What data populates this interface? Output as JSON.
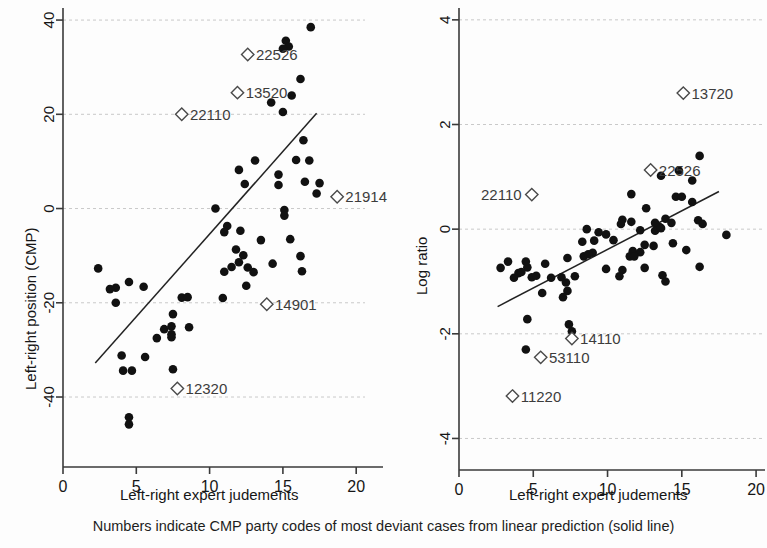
{
  "figure": {
    "caption": "Numbers indicate CMP party codes of most deviant cases from linear prediction (solid line)",
    "width": 767,
    "height": 548,
    "marker_color": "#111111",
    "line_color": "#222222",
    "grid_color": "#c9c9c9"
  },
  "chart_data": [
    {
      "id": "left",
      "type": "scatter",
      "title": "",
      "xlabel": "Left-right expert judements",
      "ylabel": "Left-right position (CMP)",
      "xlim": [
        0,
        20.6
      ],
      "ylim": [
        -47,
        41.5
      ],
      "xticks": [
        0,
        5,
        10,
        15,
        20
      ],
      "xtick_labels": [
        "0",
        "5",
        "10",
        "15",
        "20"
      ],
      "yticks": [
        -40,
        -20,
        0,
        20,
        40
      ],
      "ytick_labels": [
        "-40",
        "-20",
        "0",
        "20",
        "40"
      ],
      "grid": "horizontal",
      "legend": "none",
      "fit_line": {
        "x0": 2.2,
        "y0": -32.8,
        "x1": 17.3,
        "y1": 20.2
      },
      "points": [
        [
          16.9,
          38.5
        ],
        [
          15.2,
          35.6
        ],
        [
          15.4,
          34.4
        ],
        [
          15.0,
          33.9
        ],
        [
          16.2,
          27.5
        ],
        [
          15.6,
          24.0
        ],
        [
          14.2,
          22.5
        ],
        [
          15.0,
          20.5
        ],
        [
          16.4,
          14.5
        ],
        [
          15.9,
          10.3
        ],
        [
          16.8,
          10.2
        ],
        [
          13.1,
          10.2
        ],
        [
          12.0,
          8.2
        ],
        [
          14.7,
          7.2
        ],
        [
          16.5,
          5.7
        ],
        [
          17.5,
          5.4
        ],
        [
          12.4,
          5.2
        ],
        [
          14.7,
          5.0
        ],
        [
          17.3,
          3.2
        ],
        [
          10.4,
          0.0
        ],
        [
          15.1,
          -0.3
        ],
        [
          15.1,
          -1.5
        ],
        [
          11.2,
          -3.7
        ],
        [
          11.0,
          -5.0
        ],
        [
          12.1,
          -4.7
        ],
        [
          13.5,
          -6.7
        ],
        [
          15.5,
          -6.5
        ],
        [
          11.8,
          -8.7
        ],
        [
          12.3,
          -9.9
        ],
        [
          16.2,
          -10.1
        ],
        [
          12.0,
          -11.4
        ],
        [
          14.3,
          -11.7
        ],
        [
          11.5,
          -12.4
        ],
        [
          13.0,
          -13.5
        ],
        [
          11.0,
          -13.4
        ],
        [
          2.4,
          -12.7
        ],
        [
          3.6,
          -16.8
        ],
        [
          3.2,
          -17.1
        ],
        [
          4.5,
          -15.6
        ],
        [
          5.5,
          -16.6
        ],
        [
          3.6,
          -20.0
        ],
        [
          8.1,
          -18.9
        ],
        [
          8.5,
          -18.8
        ],
        [
          10.9,
          -19.0
        ],
        [
          12.5,
          -16.4
        ],
        [
          16.3,
          -13.3
        ],
        [
          12.6,
          -12.5
        ],
        [
          7.5,
          -22.4
        ],
        [
          6.9,
          -25.6
        ],
        [
          7.4,
          -25.0
        ],
        [
          8.6,
          -25.2
        ],
        [
          7.4,
          -26.7
        ],
        [
          7.4,
          -27.3
        ],
        [
          6.4,
          -27.5
        ],
        [
          4.0,
          -31.2
        ],
        [
          5.6,
          -31.5
        ],
        [
          4.1,
          -34.4
        ],
        [
          4.7,
          -34.4
        ],
        [
          7.5,
          -34.1
        ],
        [
          4.5,
          -44.3
        ],
        [
          4.5,
          -45.8
        ]
      ],
      "labeled_points": [
        {
          "code": "22526",
          "x": 12.6,
          "y": 32.7,
          "label_side": "right"
        },
        {
          "code": "13520",
          "x": 11.9,
          "y": 24.6,
          "label_side": "right"
        },
        {
          "code": "22110",
          "x": 8.1,
          "y": 20.0,
          "label_side": "right"
        },
        {
          "code": "21914",
          "x": 18.7,
          "y": 2.5,
          "label_side": "right"
        },
        {
          "code": "14901",
          "x": 13.9,
          "y": -20.3,
          "label_side": "right"
        },
        {
          "code": "12320",
          "x": 7.8,
          "y": -38.2,
          "label_side": "right"
        }
      ]
    },
    {
      "id": "right",
      "type": "scatter",
      "title": "",
      "xlabel": "Left-right expert judements",
      "ylabel": "Log ratio",
      "xlim": [
        0,
        20.6
      ],
      "ylim": [
        -4.45,
        4.15
      ],
      "xticks": [
        0,
        5,
        10,
        15,
        20
      ],
      "xtick_labels": [
        "0",
        "5",
        "10",
        "15",
        "20"
      ],
      "yticks": [
        -4,
        -2,
        0,
        2,
        4
      ],
      "ytick_labels": [
        "-4",
        "-2",
        "0",
        "2",
        "4"
      ],
      "grid": "horizontal",
      "legend": "none",
      "fit_line": {
        "x0": 2.6,
        "y0": -1.48,
        "x1": 17.5,
        "y1": 0.72
      },
      "points": [
        [
          16.2,
          1.4
        ],
        [
          14.8,
          1.12
        ],
        [
          13.6,
          1.02
        ],
        [
          15.7,
          0.93
        ],
        [
          11.6,
          0.67
        ],
        [
          14.6,
          0.62
        ],
        [
          15.0,
          0.62
        ],
        [
          15.7,
          0.52
        ],
        [
          12.6,
          0.4
        ],
        [
          11.0,
          0.18
        ],
        [
          11.6,
          0.14
        ],
        [
          10.9,
          0.1
        ],
        [
          13.2,
          0.12
        ],
        [
          13.9,
          0.2
        ],
        [
          14.3,
          0.12
        ],
        [
          16.1,
          0.17
        ],
        [
          16.4,
          0.1
        ],
        [
          13.5,
          0.04
        ],
        [
          13.2,
          -0.03
        ],
        [
          13.6,
          0.02
        ],
        [
          8.6,
          0.0
        ],
        [
          9.4,
          -0.06
        ],
        [
          9.9,
          -0.1
        ],
        [
          8.3,
          -0.24
        ],
        [
          9.1,
          -0.22
        ],
        [
          10.4,
          -0.21
        ],
        [
          12.2,
          -0.02
        ],
        [
          14.4,
          -0.27
        ],
        [
          18.0,
          -0.11
        ],
        [
          12.5,
          -0.3
        ],
        [
          13.1,
          -0.32
        ],
        [
          15.3,
          -0.4
        ],
        [
          11.7,
          -0.42
        ],
        [
          12.2,
          -0.44
        ],
        [
          11.5,
          -0.52
        ],
        [
          11.8,
          -0.52
        ],
        [
          9.0,
          -0.45
        ],
        [
          3.3,
          -0.62
        ],
        [
          4.6,
          -0.73
        ],
        [
          4.5,
          -0.62
        ],
        [
          5.8,
          -0.66
        ],
        [
          7.3,
          -0.55
        ],
        [
          8.4,
          -0.52
        ],
        [
          8.7,
          -0.48
        ],
        [
          2.8,
          -0.74
        ],
        [
          4.0,
          -0.84
        ],
        [
          4.2,
          -0.82
        ],
        [
          3.7,
          -0.93
        ],
        [
          4.9,
          -0.92
        ],
        [
          5.2,
          -0.89
        ],
        [
          6.9,
          -0.92
        ],
        [
          7.8,
          -0.9
        ],
        [
          9.9,
          -0.76
        ],
        [
          11.0,
          -0.78
        ],
        [
          12.5,
          -0.74
        ],
        [
          13.7,
          -0.88
        ],
        [
          16.2,
          -0.72
        ],
        [
          7.2,
          -1.02
        ],
        [
          7.3,
          -1.18
        ],
        [
          5.6,
          -1.22
        ],
        [
          7.0,
          -1.3
        ],
        [
          4.6,
          -1.72
        ],
        [
          7.4,
          -1.82
        ],
        [
          7.6,
          -1.95
        ],
        [
          4.5,
          -2.3
        ],
        [
          13.9,
          -1.0
        ],
        [
          10.8,
          -0.9
        ],
        [
          6.2,
          -0.93
        ]
      ],
      "labeled_points": [
        {
          "code": "13720",
          "x": 15.1,
          "y": 2.6,
          "label_side": "right"
        },
        {
          "code": "22526",
          "x": 12.9,
          "y": 1.13,
          "label_side": "right"
        },
        {
          "code": "22110",
          "x": 4.9,
          "y": 0.66,
          "label_side": "left"
        },
        {
          "code": "14110",
          "x": 7.6,
          "y": -2.09,
          "label_side": "right"
        },
        {
          "code": "53110",
          "x": 5.5,
          "y": -2.45,
          "label_side": "right"
        },
        {
          "code": "11220",
          "x": 3.6,
          "y": -3.19,
          "label_side": "right"
        }
      ]
    }
  ]
}
